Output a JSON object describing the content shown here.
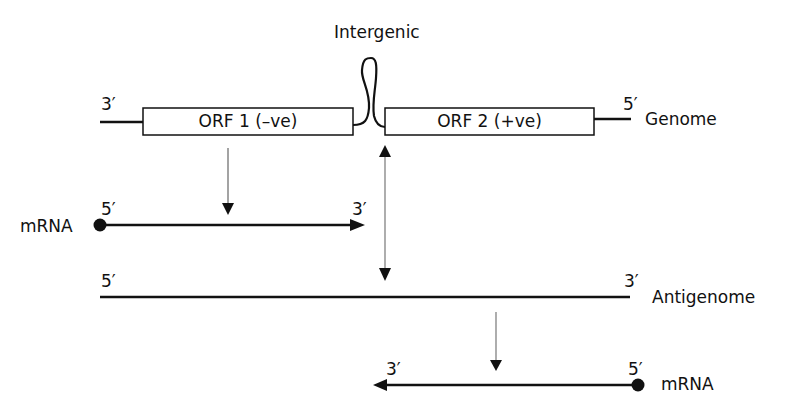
{
  "diagram": {
    "genome": {
      "label": "Genome",
      "left_end": "3′",
      "right_end": "5′",
      "orf1": "ORF 1 (–ve)",
      "orf2": "ORF 2 (+ve)",
      "intergenic": "Intergenic"
    },
    "mrna1": {
      "label": "mRNA",
      "left_end": "5′",
      "right_end": "3′"
    },
    "antigenome": {
      "label": "Antigenome",
      "left_end": "5′",
      "right_end": "3′"
    },
    "mrna2": {
      "label": "mRNA",
      "left_end": "3′",
      "right_end": "5′"
    },
    "colors": {
      "line": "#111111",
      "thin_arrow": "#555555",
      "background": "#ffffff"
    }
  }
}
